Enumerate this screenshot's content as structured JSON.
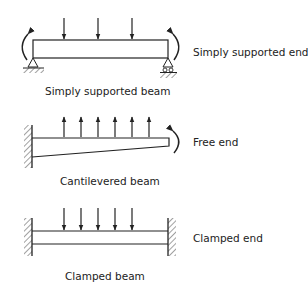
{
  "colors": {
    "ink": "#222222",
    "background": "#ffffff"
  },
  "diagrams": [
    {
      "id": "simply-supported",
      "caption": "Simply supported beam",
      "end_label": "Simply supported end",
      "load_direction": "down",
      "load_count": 3
    },
    {
      "id": "cantilevered",
      "caption": "Cantilevered beam",
      "end_label": "Free end",
      "load_direction": "up",
      "load_count": 6
    },
    {
      "id": "clamped",
      "caption": "Clamped beam",
      "end_label": "Clamped end",
      "load_direction": "down",
      "load_count": 5
    }
  ]
}
